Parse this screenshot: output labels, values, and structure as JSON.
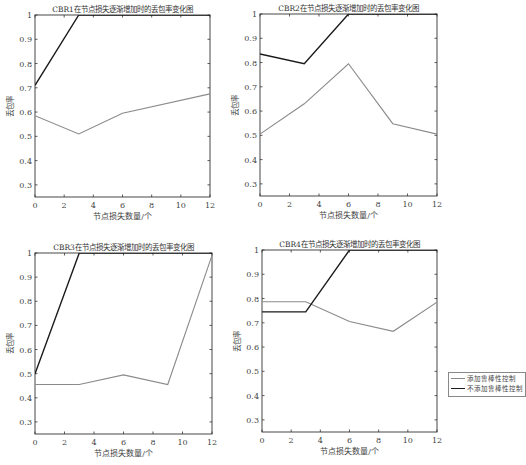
{
  "chart_data": [
    {
      "type": "line",
      "title": "CBR1在节点损失逐渐增加时的丢包率变化图",
      "xlabel": "节点损失数量/个",
      "ylabel": "丢包率",
      "xlim": [
        0,
        12
      ],
      "ylim": [
        0.25,
        1
      ],
      "xticks": [
        0,
        2,
        4,
        6,
        8,
        10,
        12
      ],
      "yticks": [
        0.3,
        0.4,
        0.5,
        0.6,
        0.7,
        0.8,
        0.9,
        1
      ],
      "series": [
        {
          "name": "添加鲁棒性控制",
          "color": "#8a8a8a",
          "x": [
            0,
            3,
            6,
            12
          ],
          "y": [
            0.585,
            0.51,
            0.595,
            0.675
          ]
        },
        {
          "name": "不添加鲁棒性控制",
          "color": "#1a1a1a",
          "x": [
            0,
            3,
            6,
            12
          ],
          "y": [
            0.71,
            1.0,
            1.0,
            1.0
          ]
        }
      ]
    },
    {
      "type": "line",
      "title": "CBR2在节点损失逐渐增加时的丢包率变化图",
      "xlabel": "节点损失数量/个",
      "ylabel": "丢包率",
      "xlim": [
        0,
        12
      ],
      "ylim": [
        0.25,
        1
      ],
      "xticks": [
        0,
        2,
        4,
        6,
        8,
        10,
        12
      ],
      "yticks": [
        0.3,
        0.4,
        0.5,
        0.6,
        0.7,
        0.8,
        0.9,
        1
      ],
      "series": [
        {
          "name": "添加鲁棒性控制",
          "color": "#8a8a8a",
          "x": [
            0,
            3,
            6,
            9,
            12
          ],
          "y": [
            0.505,
            0.63,
            0.795,
            0.548,
            0.505
          ]
        },
        {
          "name": "不添加鲁棒性控制",
          "color": "#1a1a1a",
          "x": [
            0,
            3,
            6,
            12
          ],
          "y": [
            0.835,
            0.795,
            1.0,
            1.0
          ]
        }
      ]
    },
    {
      "type": "line",
      "title": "CBR3在节点损失逐渐增加时的丢包率变化图",
      "xlabel": "节点损失数量/个",
      "ylabel": "丢包率",
      "xlim": [
        0,
        12
      ],
      "ylim": [
        0.25,
        1
      ],
      "xticks": [
        0,
        2,
        4,
        6,
        8,
        10,
        12
      ],
      "yticks": [
        0.3,
        0.4,
        0.5,
        0.6,
        0.7,
        0.8,
        0.9,
        1
      ],
      "series": [
        {
          "name": "添加鲁棒性控制",
          "color": "#8a8a8a",
          "x": [
            0,
            3,
            6,
            9,
            12
          ],
          "y": [
            0.455,
            0.455,
            0.495,
            0.455,
            0.99
          ]
        },
        {
          "name": "不添加鲁棒性控制",
          "color": "#1a1a1a",
          "x": [
            0,
            3,
            12
          ],
          "y": [
            0.5,
            1.0,
            1.0
          ]
        }
      ]
    },
    {
      "type": "line",
      "title": "CBR4在节点损失逐渐增加时的丢包率变化图",
      "xlabel": "节点损失数量/个",
      "ylabel": "丢包率",
      "xlim": [
        0,
        12
      ],
      "ylim": [
        0.25,
        1
      ],
      "xticks": [
        0,
        2,
        4,
        6,
        8,
        10,
        12
      ],
      "yticks": [
        0.3,
        0.4,
        0.5,
        0.6,
        0.7,
        0.8,
        0.9,
        1
      ],
      "series": [
        {
          "name": "添加鲁棒性控制",
          "color": "#8a8a8a",
          "x": [
            0,
            3,
            6,
            9,
            12
          ],
          "y": [
            0.787,
            0.787,
            0.705,
            0.665,
            0.785
          ]
        },
        {
          "name": "不添加鲁棒性控制",
          "color": "#1a1a1a",
          "x": [
            0,
            3,
            6,
            12
          ],
          "y": [
            0.745,
            0.745,
            1.0,
            1.0
          ]
        }
      ]
    }
  ],
  "panels": [
    {
      "title": "CBR1在节点损失逐渐增加时的丢包率变化图",
      "xlabel": "节点损失数量/个",
      "ylabel": "丢包率"
    },
    {
      "title": "CBR2在节点损失逐渐增加时的丢包率变化图",
      "xlabel": "节点损失数量/个",
      "ylabel": "丢包率"
    },
    {
      "title": "CBR3在节点损失逐渐增加时的丢包率变化图",
      "xlabel": "节点损失数量/个",
      "ylabel": "丢包率"
    },
    {
      "title": "CBR4在节点损失逐渐增加时的丢包率变化图",
      "xlabel": "节点损失数量/个",
      "ylabel": "丢包率"
    }
  ],
  "legend": {
    "items": [
      {
        "label": "添加鲁棒性控制",
        "color": "#8a8a8a"
      },
      {
        "label": "不添加鲁棒性控制",
        "color": "#1a1a1a"
      }
    ]
  }
}
